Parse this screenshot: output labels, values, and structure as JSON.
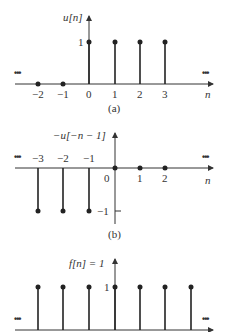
{
  "diagram": {
    "panels": [
      {
        "id": "a",
        "caption": "(a)",
        "ylabel": "u[n]",
        "xlabel": "n",
        "y_tick": "1",
        "x_ticks": [
          "−2",
          "−1",
          "0",
          "1",
          "2",
          "3"
        ],
        "stems": [
          {
            "n": -2,
            "value": 0
          },
          {
            "n": -1,
            "value": 0
          },
          {
            "n": 0,
            "value": 1
          },
          {
            "n": 1,
            "value": 1
          },
          {
            "n": 2,
            "value": 1
          },
          {
            "n": 3,
            "value": 1
          }
        ],
        "ellipsis_left": "•••",
        "ellipsis_right": "•••"
      },
      {
        "id": "b",
        "caption": "(b)",
        "ylabel": "−u[−n − 1]",
        "xlabel": "n",
        "y_tick": "−1",
        "x_ticks": [
          "−3",
          "−2",
          "−1",
          "0",
          "1",
          "2"
        ],
        "stems": [
          {
            "n": -3,
            "value": -1
          },
          {
            "n": -2,
            "value": -1
          },
          {
            "n": -1,
            "value": -1
          },
          {
            "n": 0,
            "value": 0
          },
          {
            "n": 1,
            "value": 0
          },
          {
            "n": 2,
            "value": 0
          }
        ],
        "ellipsis_left": "•••",
        "ellipsis_right": "•••"
      },
      {
        "id": "c",
        "ylabel": "f[n] = 1",
        "y_tick": "1",
        "stems": [
          {
            "n": -3,
            "value": 1
          },
          {
            "n": -2,
            "value": 1
          },
          {
            "n": -1,
            "value": 1
          },
          {
            "n": 0,
            "value": 1
          },
          {
            "n": 1,
            "value": 1
          },
          {
            "n": 2,
            "value": 1
          },
          {
            "n": 3,
            "value": 1
          }
        ],
        "ellipsis_left": "•••",
        "ellipsis_right": "•••"
      }
    ]
  }
}
